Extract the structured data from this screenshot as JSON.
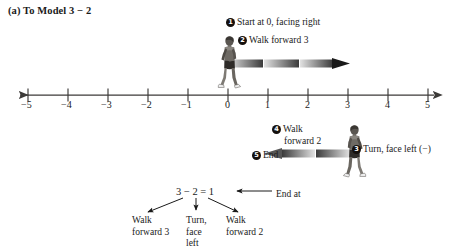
{
  "figure": {
    "caption": "(a) To Model  3 − 2"
  },
  "number_line": {
    "ticks": [
      {
        "value": -5,
        "label": "−5"
      },
      {
        "value": -4,
        "label": "−4"
      },
      {
        "value": -3,
        "label": "−3"
      },
      {
        "value": -2,
        "label": "−2"
      },
      {
        "value": -1,
        "label": "−1"
      },
      {
        "value": 0,
        "label": "0"
      },
      {
        "value": 1,
        "label": "1"
      },
      {
        "value": 2,
        "label": "2"
      },
      {
        "value": 3,
        "label": "3"
      },
      {
        "value": 4,
        "label": "4"
      },
      {
        "value": 5,
        "label": "5"
      }
    ],
    "left_arrow": true,
    "right_arrow": true,
    "axis_color": "#3c3a38"
  },
  "steps": [
    {
      "number": "❶",
      "badge": "1",
      "text": "Start at 0, facing right"
    },
    {
      "number": "❷",
      "badge": "2",
      "text": "Walk forward 3"
    },
    {
      "number": "❸",
      "badge": "3",
      "text": "Turn, face left (−)"
    },
    {
      "number": "❹",
      "badge": "4",
      "line1": "Walk",
      "line2": "forward 2"
    },
    {
      "number": "❺",
      "badge": "5",
      "text": "End"
    }
  ],
  "walk_arrows": [
    {
      "name": "walk-forward-3",
      "from": 0,
      "to": 3,
      "direction": "right",
      "segments": 3
    },
    {
      "name": "walk-forward-2",
      "from": 3,
      "to": 1,
      "direction": "left",
      "segments": 2
    }
  ],
  "walkers": [
    {
      "name": "walker-facing-right",
      "position": 0,
      "facing": "right"
    },
    {
      "name": "walker-facing-left",
      "position": 3,
      "facing": "left"
    }
  ],
  "tree": {
    "equation": "3 − 2 = 1",
    "end_at_label": "End at",
    "leaves": [
      {
        "name": "walk-forward-3",
        "line1": "Walk",
        "line2": "forward 3",
        "line3": ""
      },
      {
        "name": "turn-face-left",
        "line1": "Turn,",
        "line2": "face",
        "line3": "left"
      },
      {
        "name": "walk-forward-2",
        "line1": "Walk",
        "line2": "forward 2",
        "line3": ""
      }
    ]
  },
  "colors": {
    "ink": "#1a1a1a",
    "axis": "#3c3a38",
    "arrow_light": "#d8d8d8",
    "arrow_dark": "#2b2b2b",
    "badge_bg": "#15100d"
  }
}
